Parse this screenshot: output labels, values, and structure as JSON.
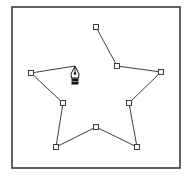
{
  "diagram": {
    "frame": {
      "x": 12,
      "y": 7,
      "width": 168,
      "height": 161,
      "stroke": "#3a3a3a"
    },
    "path_color": "#2a2a2a",
    "anchors": [
      {
        "x": 96,
        "y": 27
      },
      {
        "x": 117,
        "y": 66
      },
      {
        "x": 161,
        "y": 72
      },
      {
        "x": 129,
        "y": 103
      },
      {
        "x": 137,
        "y": 147
      },
      {
        "x": 96,
        "y": 127
      },
      {
        "x": 56,
        "y": 147
      },
      {
        "x": 63,
        "y": 103
      },
      {
        "x": 31,
        "y": 73
      }
    ],
    "open_segment_end": {
      "x": 75,
      "y": 66
    },
    "cursor": {
      "icon": "pen-tool-icon",
      "x": 75,
      "y": 66
    }
  }
}
